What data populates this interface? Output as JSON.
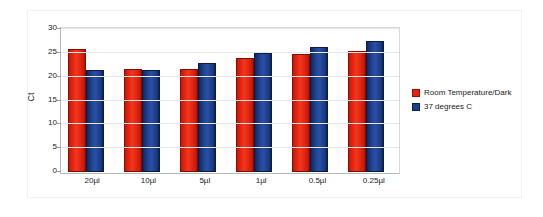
{
  "chart_data": {
    "type": "bar",
    "title": "",
    "subtitle": "",
    "xlabel": "",
    "ylabel": "Ct",
    "ylim": [
      0,
      30
    ],
    "ytick_step": 5,
    "yticks": [
      30,
      25,
      20,
      15,
      10,
      5,
      0
    ],
    "grid": true,
    "legend_position": "right",
    "categories": [
      "20µl",
      "10µl",
      "5µl",
      "1µl",
      "0.5µl",
      "0.25µl"
    ],
    "series": [
      {
        "name": "Room Temperature/Dark",
        "color": "#e8220e",
        "values": [
          25.7,
          21.7,
          21.6,
          23.9,
          24.7,
          25.3
        ]
      },
      {
        "name": "37 degrees C",
        "color": "#1c3f8c",
        "values": [
          21.3,
          21.4,
          22.8,
          24.9,
          26.2,
          27.5
        ]
      }
    ]
  },
  "colors": {
    "series_0": "#e8220e",
    "series_1": "#1c3f8c",
    "gridline": "#e6e6e6",
    "axis": "#b8b8b8",
    "frame": "#f2f2f2",
    "text": "#1a1a1a",
    "background": "#ffffff"
  }
}
